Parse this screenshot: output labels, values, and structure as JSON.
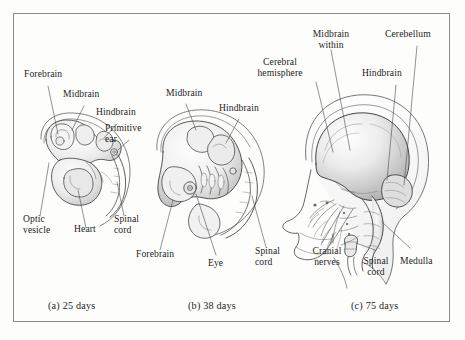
{
  "figure": {
    "background_color": "#fdfdfc",
    "border_color": "#8a8a8a",
    "ink_color": "#1d1d1d"
  },
  "panels": [
    {
      "id": "a",
      "caption": "(a) 25 days",
      "age_days": 25,
      "labels": [
        {
          "name": "forebrain",
          "text": "Forebrain"
        },
        {
          "name": "midbrain",
          "text": "Midbrain"
        },
        {
          "name": "hindbrain",
          "text": "Hindbrain"
        },
        {
          "name": "primitive-ear",
          "text": "Primitive\near"
        },
        {
          "name": "optic-vesicle",
          "text": "Optic\nvesicle"
        },
        {
          "name": "heart",
          "text": "Heart"
        },
        {
          "name": "spinal-cord",
          "text": "Spinal\ncord"
        }
      ]
    },
    {
      "id": "b",
      "caption": "(b) 38 days",
      "age_days": 38,
      "labels": [
        {
          "name": "midbrain",
          "text": "Midbrain"
        },
        {
          "name": "hindbrain",
          "text": "Hindbrain"
        },
        {
          "name": "forebrain",
          "text": "Forebrain"
        },
        {
          "name": "eye",
          "text": "Eye"
        },
        {
          "name": "spinal-cord",
          "text": "Spinal\ncord"
        }
      ]
    },
    {
      "id": "c",
      "caption": "(c) 75 days",
      "age_days": 75,
      "labels": [
        {
          "name": "cerebral-hemisphere",
          "text": "Cerebral\nhemisphere"
        },
        {
          "name": "midbrain-within",
          "text": "Midbrain\nwithin"
        },
        {
          "name": "cerebellum",
          "text": "Cerebellum"
        },
        {
          "name": "hindbrain",
          "text": "Hindbrain"
        },
        {
          "name": "cranial-nerves",
          "text": "Cranial\nnerves"
        },
        {
          "name": "spinal-cord",
          "text": "Spinal\ncord"
        },
        {
          "name": "medulla",
          "text": "Medulla"
        }
      ]
    }
  ]
}
